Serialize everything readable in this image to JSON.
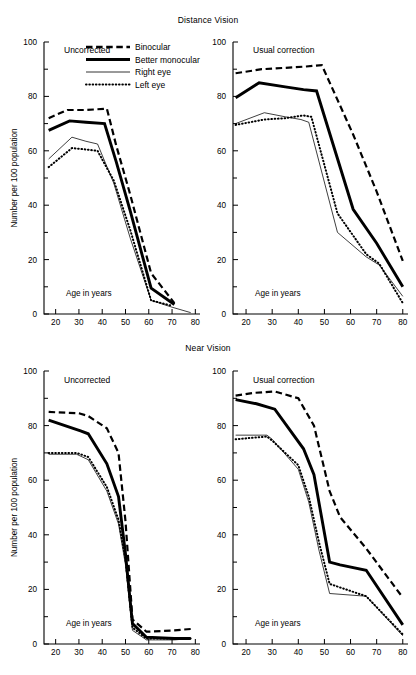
{
  "figure": {
    "width": 416,
    "height": 675,
    "background": "#ffffff",
    "ink_color": "#000000"
  },
  "groups": [
    {
      "id": "distance",
      "title": "Distance Vision"
    },
    {
      "id": "near",
      "title": "Near Vision"
    }
  ],
  "legend": {
    "position": "inside top-left panel, upper area",
    "entries": [
      {
        "key": "binocular",
        "label": "Binocular",
        "style": "dashed-thick"
      },
      {
        "key": "better_monocular",
        "label": "Better monocular",
        "style": "solid-thick"
      },
      {
        "key": "right_eye",
        "label": "Right eye",
        "style": "solid-thin"
      },
      {
        "key": "left_eye",
        "label": "Left eye",
        "style": "dotted"
      }
    ]
  },
  "axes": {
    "ylabel": "Number per 100 population",
    "xlabel": "Age in years",
    "ylim": [
      0,
      100
    ],
    "xlim": [
      15,
      82
    ],
    "ytick_labels": [
      "0",
      "20",
      "40",
      "60",
      "80",
      "100"
    ],
    "ytick_values": [
      0,
      20,
      40,
      60,
      80,
      100
    ],
    "yminor_values": [
      10,
      30,
      50,
      70,
      90
    ],
    "xtick_labels": [
      "20",
      "30",
      "40",
      "50",
      "60",
      "70",
      "80"
    ],
    "xtick_values": [
      20,
      30,
      40,
      50,
      60,
      70,
      80
    ],
    "grid": false
  },
  "chart_data": {
    "type": "line",
    "xlabel": "Age in years",
    "ylabel": "Number per 100 population",
    "xlim": [
      15,
      82
    ],
    "ylim": [
      0,
      100
    ],
    "grid": false,
    "legend": [
      "Binocular",
      "Better monocular",
      "Right eye",
      "Left eye"
    ],
    "panels": [
      {
        "group": "Distance Vision",
        "panel": "Uncorrected",
        "position": "top-left",
        "series": [
          {
            "name": "Binocular",
            "x": [
              17,
              25,
              33,
              42,
              46,
              52,
              61,
              71
            ],
            "y": [
              72.0,
              75.0,
              75.0,
              75.5,
              62.0,
              44.0,
              15.0,
              4.0
            ]
          },
          {
            "name": "Better monocular",
            "x": [
              17,
              26,
              33,
              41,
              46,
              52,
              61,
              71
            ],
            "y": [
              67.5,
              71.0,
              70.5,
              70.0,
              56.0,
              38.0,
              9.5,
              3.5
            ]
          },
          {
            "name": "Right eye",
            "x": [
              17,
              27,
              33,
              38,
              45,
              52,
              61,
              70,
              78
            ],
            "y": [
              57.0,
              65.0,
              63.5,
              62.5,
              48.0,
              28.0,
              5.0,
              2.5,
              0.5
            ]
          },
          {
            "name": "Left eye",
            "x": [
              17,
              27,
              33,
              38,
              45,
              52,
              61,
              70
            ],
            "y": [
              54.0,
              61.0,
              60.5,
              60.0,
              49.0,
              31.0,
              5.0,
              3.0
            ]
          }
        ]
      },
      {
        "group": "Distance Vision",
        "panel": "Usual correction",
        "position": "top-right",
        "series": [
          {
            "name": "Binocular",
            "x": [
              16,
              26,
              35,
              43,
              49,
              61,
              70,
              80
            ],
            "y": [
              88.5,
              90.0,
              90.5,
              91.0,
              91.5,
              66.0,
              45.0,
              19.5
            ]
          },
          {
            "name": "Better monocular",
            "x": [
              16,
              25,
              35,
              42,
              47,
              61,
              70,
              80
            ],
            "y": [
              79.5,
              85.0,
              83.5,
              82.5,
              82.0,
              38.5,
              26.0,
              10.0
            ]
          },
          {
            "name": "Right eye",
            "x": [
              16,
              27,
              35,
              41,
              44,
              55,
              66,
              71,
              80
            ],
            "y": [
              70.0,
              74.0,
              72.5,
              71.5,
              70.5,
              30.0,
              21.0,
              18.0,
              6.5
            ]
          },
          {
            "name": "Left eye",
            "x": [
              16,
              27,
              35,
              42,
              45,
              55,
              66,
              71,
              80
            ],
            "y": [
              69.5,
              71.5,
              72.0,
              73.0,
              72.5,
              37.0,
              22.0,
              18.5,
              4.0
            ]
          }
        ]
      },
      {
        "group": "Near Vision",
        "panel": "Uncorrected",
        "position": "bottom-left",
        "series": [
          {
            "name": "Binocular",
            "x": [
              17,
              30,
              34,
              42,
              47,
              50,
              53,
              59,
              71,
              78
            ],
            "y": [
              85.0,
              84.5,
              83.5,
              79.0,
              70.0,
              45.0,
              9.0,
              4.5,
              5.0,
              5.5
            ]
          },
          {
            "name": "Better monocular",
            "x": [
              17,
              31,
              34,
              42,
              47,
              50,
              53,
              59,
              71,
              78
            ],
            "y": [
              82.0,
              78.0,
              77.0,
              66.0,
              54.0,
              33.0,
              7.5,
              2.5,
              2.0,
              2.0
            ]
          },
          {
            "name": "Right eye",
            "x": [
              17,
              29,
              34,
              42,
              47,
              50,
              53,
              59,
              71,
              78
            ],
            "y": [
              69.5,
              69.5,
              67.5,
              56.0,
              44.0,
              29.0,
              5.0,
              1.5,
              1.5,
              2.0
            ]
          },
          {
            "name": "Left eye",
            "x": [
              17,
              29,
              34,
              42,
              47,
              50,
              53,
              59,
              71,
              78
            ],
            "y": [
              70.0,
              70.0,
              68.5,
              57.5,
              45.5,
              31.0,
              6.0,
              2.0,
              2.0,
              2.0
            ]
          }
        ]
      },
      {
        "group": "Near Vision",
        "panel": "Usual correction",
        "position": "bottom-right",
        "series": [
          {
            "name": "Binocular",
            "x": [
              16,
              23,
              31,
              40,
              46,
              52,
              56,
              66,
              80
            ],
            "y": [
              91.0,
              92.0,
              92.5,
              90.0,
              80.0,
              56.0,
              46.5,
              35.0,
              17.0
            ]
          },
          {
            "name": "Better monocular",
            "x": [
              16,
              24,
              31,
              42,
              46,
              52,
              56,
              66,
              80
            ],
            "y": [
              89.5,
              88.0,
              86.0,
              71.5,
              62.0,
              30.0,
              29.0,
              27.0,
              7.0
            ]
          },
          {
            "name": "Right eye",
            "x": [
              16,
              28,
              30,
              40,
              44,
              48,
              52,
              66,
              80
            ],
            "y": [
              76.5,
              76.5,
              75.0,
              64.0,
              52.0,
              34.0,
              18.5,
              17.5,
              3.0
            ]
          },
          {
            "name": "Left eye",
            "x": [
              16,
              28,
              30,
              40,
              44,
              48,
              52,
              66,
              80
            ],
            "y": [
              75.0,
              76.0,
              74.5,
              65.5,
              54.0,
              37.0,
              22.0,
              17.5,
              3.5
            ]
          }
        ]
      }
    ]
  },
  "panels": [
    {
      "id": "dist-unc",
      "label": "Uncorrected",
      "xlabel": "Age in years",
      "ylabel": "Number per 100 population",
      "show_ylabel": true,
      "show_legend": true
    },
    {
      "id": "dist-cor",
      "label": "Usual correction",
      "xlabel": "Age in years",
      "ylabel": "",
      "show_ylabel": false,
      "show_legend": false
    },
    {
      "id": "near-unc",
      "label": "Uncorrected",
      "xlabel": "Age in years",
      "ylabel": "Number per 100 population",
      "show_ylabel": true,
      "show_legend": false
    },
    {
      "id": "near-cor",
      "label": "Usual correction",
      "xlabel": "Age in years",
      "ylabel": "",
      "show_ylabel": false,
      "show_legend": false
    }
  ]
}
